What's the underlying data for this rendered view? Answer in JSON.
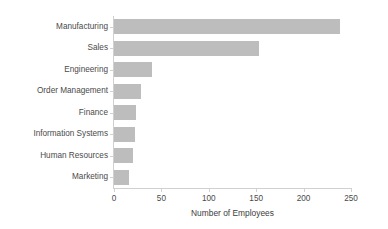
{
  "chart_data": {
    "type": "bar",
    "orientation": "horizontal",
    "title": "",
    "xlabel": "Number of Employees",
    "ylabel": "",
    "xlim": [
      0,
      250
    ],
    "xticks": [
      0,
      50,
      100,
      150,
      200,
      250
    ],
    "grid": false,
    "legend": null,
    "bar_color": "#bdbdbd",
    "categories": [
      "Manufacturing",
      "Sales",
      "Engineering",
      "Order Management",
      "Finance",
      "Information Systems",
      "Human Resources",
      "Marketing"
    ],
    "values": [
      238,
      153,
      40,
      29,
      23,
      22,
      20,
      16
    ]
  },
  "axis": {
    "x_title": "Number of Employees",
    "tick_labels": [
      "0",
      "50",
      "100",
      "150",
      "200",
      "250"
    ]
  },
  "categories": [
    {
      "label": "Manufacturing",
      "value": 238
    },
    {
      "label": "Sales",
      "value": 153
    },
    {
      "label": "Engineering",
      "value": 40
    },
    {
      "label": "Order Management",
      "value": 29
    },
    {
      "label": "Finance",
      "value": 23
    },
    {
      "label": "Information Systems",
      "value": 22
    },
    {
      "label": "Human Resources",
      "value": 20
    },
    {
      "label": "Marketing",
      "value": 16
    }
  ]
}
